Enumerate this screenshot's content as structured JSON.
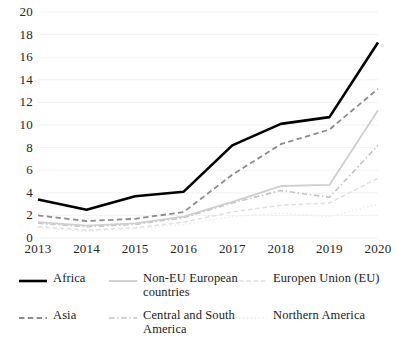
{
  "chart_data": {
    "type": "line",
    "title": "",
    "subtitle": "",
    "xlabel": "",
    "ylabel": "",
    "categories": [
      "2013",
      "2014",
      "2015",
      "2016",
      "2017",
      "2018",
      "2019",
      "2020"
    ],
    "x": [
      2013,
      2014,
      2015,
      2016,
      2017,
      2018,
      2019,
      2020
    ],
    "ylim": [
      0,
      20
    ],
    "yticks": [
      0,
      2,
      4,
      6,
      8,
      10,
      12,
      14,
      16,
      18,
      20
    ],
    "ytick_labels": [
      "0",
      "2",
      "4",
      "6",
      "8",
      "10",
      "12",
      "14",
      "16",
      "18",
      "20"
    ],
    "grid": true,
    "grid_axis": "y",
    "legend_position": "bottom",
    "legend_columns": 3,
    "series": [
      {
        "name": "Africa",
        "values": [
          3.4,
          2.5,
          3.7,
          4.1,
          8.2,
          10.1,
          10.7,
          17.3
        ],
        "color": "#000000",
        "dash": "none",
        "width": 2.6
      },
      {
        "name": "Asia",
        "values": [
          2.0,
          1.5,
          1.7,
          2.3,
          5.6,
          8.3,
          9.6,
          13.2
        ],
        "color": "#8c8c8c",
        "dash": "dashed",
        "width": 1.8
      },
      {
        "name": "Non-EU European countries",
        "values": [
          1.4,
          1.1,
          1.3,
          1.9,
          3.2,
          4.6,
          4.7,
          11.3
        ],
        "color": "#cfcfcf",
        "dash": "none",
        "width": 1.8
      },
      {
        "name": "Central and South America",
        "values": [
          1.3,
          1.0,
          1.2,
          1.8,
          3.1,
          4.2,
          3.6,
          8.2
        ],
        "color": "#c4c4c4",
        "dash": "dashdot",
        "width": 1.6
      },
      {
        "name": "Europen Union (EU)",
        "values": [
          1.0,
          0.7,
          0.9,
          1.4,
          2.3,
          2.9,
          3.1,
          5.3
        ],
        "color": "#e0e0e0",
        "dash": "dashed",
        "width": 1.5
      },
      {
        "name": "Northern America",
        "values": [
          0.9,
          0.6,
          0.8,
          1.2,
          1.9,
          2.2,
          1.9,
          3.0
        ],
        "color": "#ececec",
        "dash": "dotted",
        "width": 1.4
      }
    ]
  },
  "legend": {
    "entries": [
      {
        "label": "Africa",
        "key": "africa"
      },
      {
        "label": "Non-EU European\ncountries",
        "key": "non-eu-european-countries"
      },
      {
        "label": "Europen Union (EU)",
        "key": "european-union"
      },
      {
        "label": "Asia",
        "key": "asia"
      },
      {
        "label": "Central and South\nAmerica",
        "key": "central-and-south-america"
      },
      {
        "label": "Northern America",
        "key": "northern-america"
      }
    ]
  }
}
